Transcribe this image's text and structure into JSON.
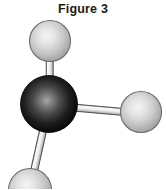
{
  "figure": {
    "title": "Figure 3",
    "canvas": {
      "width": 166,
      "height": 189,
      "background": "#ffffff"
    },
    "caption_color": "#1a1a1a"
  },
  "molecule": {
    "description": "ball-and-stick molecular model with one dark central atom bonded to three light atoms",
    "geometry": "trigonal",
    "atoms": [
      {
        "id": "central-atom",
        "label": "central dark atom",
        "cx": 49,
        "cy": 104,
        "r": 28.5,
        "fill": "#0b0b0b",
        "highlight": "#9a9a9a",
        "outline": "#000000"
      },
      {
        "id": "atom-top",
        "label": "upper light atom",
        "cx": 50,
        "cy": 41,
        "r": 20.5,
        "fill": "#bdbdbd",
        "highlight": "#eeeeee",
        "outline": "#6d6d6d"
      },
      {
        "id": "atom-right",
        "label": "right light atom",
        "cx": 141,
        "cy": 112,
        "r": 20.5,
        "fill": "#bdbdbd",
        "highlight": "#eeeeee",
        "outline": "#6d6d6d"
      },
      {
        "id": "atom-bottom-left",
        "label": "lower left light atom",
        "cx": 30,
        "cy": 190,
        "r": 21.5,
        "fill": "#bdbdbd",
        "highlight": "#eeeeee",
        "outline": "#6d6d6d"
      }
    ],
    "bonds": [
      {
        "id": "bond-top",
        "from": "central-atom",
        "to": "atom-top",
        "x1": 49,
        "y1": 104,
        "x2": 50,
        "y2": 41,
        "width": 7,
        "fill": "#f2f2f2",
        "outline": "#4a4a4a"
      },
      {
        "id": "bond-right",
        "from": "central-atom",
        "to": "atom-right",
        "x1": 49,
        "y1": 104,
        "x2": 141,
        "y2": 112,
        "width": 7,
        "fill": "#f2f2f2",
        "outline": "#4a4a4a"
      },
      {
        "id": "bond-bottom-left",
        "from": "central-atom",
        "to": "atom-bottom-left",
        "x1": 49,
        "y1": 104,
        "x2": 30,
        "y2": 190,
        "width": 7,
        "fill": "#f2f2f2",
        "outline": "#4a4a4a"
      }
    ]
  }
}
